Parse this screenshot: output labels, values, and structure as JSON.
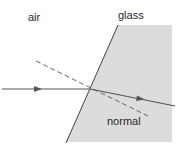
{
  "diagram": {
    "labels": {
      "medium_left": "air",
      "medium_right": "glass",
      "normal": "normal"
    },
    "colors": {
      "glass_fill": "#dcdcdc",
      "ray": "#555555",
      "normal_line": "#666666",
      "boundary": "#444444",
      "text": "#2a2a2a"
    },
    "elements": [
      {
        "type": "region",
        "name": "glass",
        "points": [
          [
            118,
            25
          ],
          [
            172,
            25
          ],
          [
            172,
            142
          ],
          [
            66,
            142
          ]
        ]
      },
      {
        "type": "line",
        "name": "boundary",
        "from": [
          118,
          25
        ],
        "to": [
          66,
          143
        ]
      },
      {
        "type": "ray",
        "name": "incident-ray",
        "from": [
          2,
          89
        ],
        "to": [
          90,
          89
        ],
        "arrow": true
      },
      {
        "type": "ray",
        "name": "refracted-ray",
        "from": [
          90,
          89
        ],
        "to": [
          175,
          106
        ],
        "arrow": true
      },
      {
        "type": "dashed-line",
        "name": "normal",
        "from": [
          36,
          61
        ],
        "to": [
          148,
          116
        ]
      }
    ]
  }
}
